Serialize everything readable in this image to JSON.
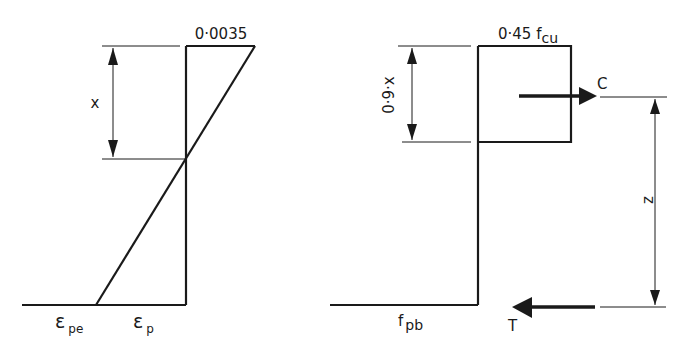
{
  "strain_diagram": {
    "top_label": "0·0035",
    "depth_label": "x",
    "strain_pe": {
      "symbol": "ε",
      "subscript": "pe"
    },
    "strain_p": {
      "symbol": "ε",
      "subscript": "p"
    }
  },
  "stress_diagram": {
    "top_label": {
      "main": "0·45 f",
      "subscript": "cu"
    },
    "block_depth_label": "0·9·x",
    "compression_label": "C",
    "tension_label": "T",
    "lever_arm_label": "z",
    "steel_stress": {
      "symbol": "f",
      "subscript": "pb"
    }
  },
  "colors": {
    "ink": "#1a1a1a",
    "background": "#ffffff"
  }
}
